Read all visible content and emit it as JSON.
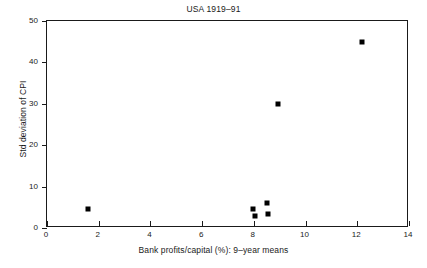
{
  "chart_data": {
    "type": "scatter",
    "title": "USA 1919–91",
    "xlabel": "Bank profits/capital (%): 9–year means",
    "ylabel": "Std deviation of CPI",
    "xlim": [
      0,
      14
    ],
    "ylim": [
      0,
      50
    ],
    "xticks": [
      0,
      2,
      4,
      6,
      8,
      10,
      12,
      14
    ],
    "yticks": [
      0,
      10,
      20,
      30,
      40,
      50
    ],
    "xtick_labels": [
      "0",
      "2",
      "4",
      "6",
      "8",
      "10",
      "12",
      "14"
    ],
    "ytick_labels": [
      "0",
      "10",
      "20",
      "30",
      "40",
      "50"
    ],
    "grid": false,
    "legend": false,
    "marker_style": "filled-square",
    "marker_color": "#000000",
    "points": [
      {
        "x": 1.6,
        "y": 4.6
      },
      {
        "x": 7.95,
        "y": 4.5
      },
      {
        "x": 8.05,
        "y": 2.8
      },
      {
        "x": 8.5,
        "y": 6.0
      },
      {
        "x": 8.55,
        "y": 3.4
      },
      {
        "x": 8.95,
        "y": 30.0
      },
      {
        "x": 12.2,
        "y": 45.0
      }
    ]
  }
}
